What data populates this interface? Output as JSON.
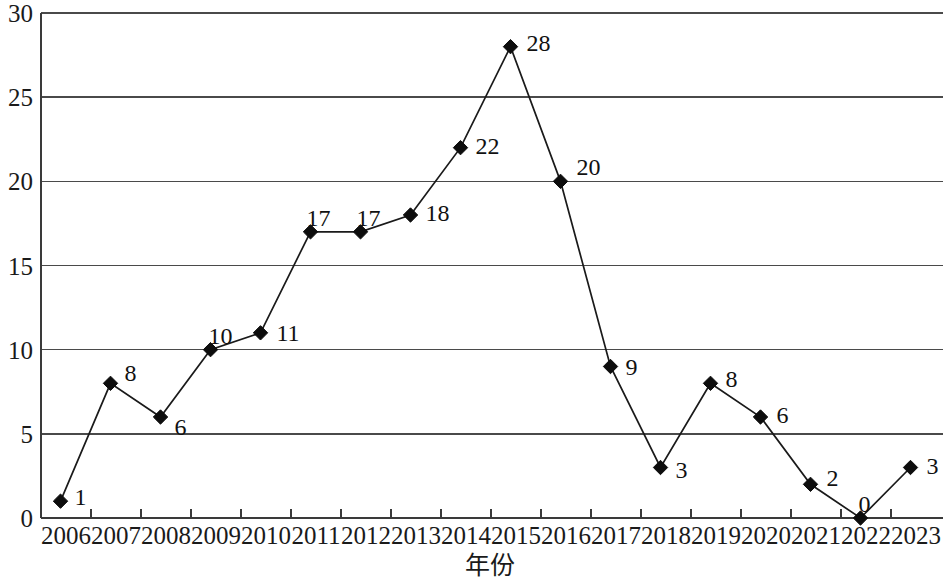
{
  "chart_data": {
    "type": "line",
    "title": "",
    "xlabel": "年份",
    "ylabel": "",
    "categories": [
      "2006",
      "2007",
      "2008",
      "2009",
      "2010",
      "2011",
      "2012",
      "2013",
      "2014",
      "2015",
      "2016",
      "2017",
      "2018",
      "2019",
      "2020",
      "2021",
      "2022",
      "2023"
    ],
    "values": [
      1,
      8,
      6,
      10,
      11,
      17,
      17,
      18,
      22,
      28,
      20,
      9,
      3,
      8,
      6,
      2,
      0,
      3
    ],
    "series": [
      {
        "name": "",
        "values": [
          1,
          8,
          6,
          10,
          11,
          17,
          17,
          18,
          22,
          28,
          20,
          9,
          3,
          8,
          6,
          2,
          0,
          3
        ]
      }
    ],
    "data_labels": [
      "1",
      "8",
      "6",
      "10",
      "11",
      "17",
      "17",
      "18",
      "22",
      "28",
      "20",
      "9",
      "3",
      "8",
      "6",
      "2",
      "0",
      "3"
    ],
    "ylim": [
      0,
      30
    ],
    "y_ticks": [
      "0",
      "5",
      "10",
      "15",
      "20",
      "25",
      "30"
    ],
    "y_tick_values": [
      0,
      5,
      10,
      15,
      20,
      25,
      30
    ],
    "grid": "horizontal",
    "legend": "none",
    "marker": "diamond",
    "line_color": "#1a1a1a",
    "marker_color": "#0d0d0d",
    "grid_color": "#4a4a4a",
    "background_color": "#ffffff",
    "label_offsets": [
      {
        "dx": 14,
        "dy": -4
      },
      {
        "dx": 14,
        "dy": -10
      },
      {
        "dx": 14,
        "dy": 10
      },
      {
        "dx": -2,
        "dy": -14
      },
      {
        "dx": 16,
        "dy": 0
      },
      {
        "dx": -4,
        "dy": -14
      },
      {
        "dx": -4,
        "dy": -14
      },
      {
        "dx": 15,
        "dy": -2
      },
      {
        "dx": 15,
        "dy": -2
      },
      {
        "dx": 16,
        "dy": -4
      },
      {
        "dx": 16,
        "dy": -14
      },
      {
        "dx": 15,
        "dy": 0
      },
      {
        "dx": 15,
        "dy": 2
      },
      {
        "dx": 15,
        "dy": -4
      },
      {
        "dx": 16,
        "dy": -2
      },
      {
        "dx": 16,
        "dy": -6
      },
      {
        "dx": -2,
        "dy": -14
      },
      {
        "dx": 16,
        "dy": -2
      }
    ]
  }
}
